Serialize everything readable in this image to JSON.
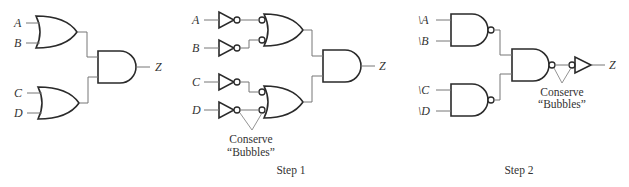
{
  "figure": {
    "panels": [
      {
        "id": "original",
        "inputs": [
          "A",
          "B",
          "C",
          "D"
        ],
        "output": "Z",
        "caption": ""
      },
      {
        "id": "step1",
        "inputs": [
          "A",
          "B",
          "C",
          "D"
        ],
        "output": "Z",
        "annotation_line1": "Conserve",
        "annotation_line2": "“Bubbles”",
        "caption": "Step 1"
      },
      {
        "id": "step2",
        "inputs": [
          "\\A",
          "\\B",
          "\\C",
          "\\D"
        ],
        "output": "Z",
        "annotation_line1": "Conserve",
        "annotation_line2": "“Bubbles”",
        "caption": "Step 2"
      }
    ]
  }
}
